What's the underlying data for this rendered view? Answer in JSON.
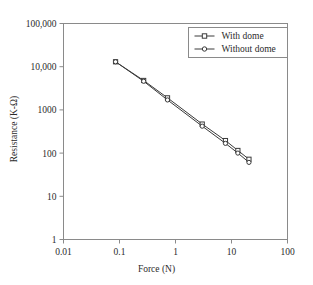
{
  "chart_data": {
    "type": "line",
    "title": "",
    "xlabel": "Force (N)",
    "ylabel": "Resistance (K-Ω)",
    "xscale": "log",
    "yscale": "log",
    "xlim": [
      0.01,
      100
    ],
    "ylim": [
      1,
      100000
    ],
    "grid": false,
    "legend_position": "top-right",
    "xticks": [
      0.01,
      0.1,
      1,
      10,
      100
    ],
    "xtick_labels": [
      "0.01",
      "0.1",
      "1",
      "10",
      "100"
    ],
    "yticks": [
      1,
      10,
      100,
      1000,
      10000,
      100000
    ],
    "ytick_labels": [
      "1",
      "10",
      "100",
      "1000",
      "10,000",
      "100,000"
    ],
    "series": [
      {
        "name": "With dome",
        "marker": "square",
        "color": "#3a3a3a",
        "x": [
          0.085,
          0.27,
          0.72,
          3.0,
          7.8,
          13.0,
          20.5
        ],
        "y": [
          13000,
          4800,
          1900,
          470,
          195,
          115,
          72
        ]
      },
      {
        "name": "Without dome",
        "marker": "circle",
        "color": "#3a3a3a",
        "x": [
          0.085,
          0.27,
          0.72,
          3.0,
          7.8,
          13.0,
          20.5
        ],
        "y": [
          13000,
          4600,
          1700,
          420,
          168,
          100,
          61
        ]
      }
    ]
  },
  "legend": {
    "items": [
      {
        "label": "With dome"
      },
      {
        "label": "Without dome"
      }
    ]
  },
  "axes": {
    "x_title": "Force (N)",
    "y_title": "Resistance (K-Ω)"
  },
  "style": {
    "frame_color": "#8a8a8a",
    "text_color": "#2b2b2b",
    "line_color": "#3a3a3a",
    "background": "#ffffff"
  }
}
